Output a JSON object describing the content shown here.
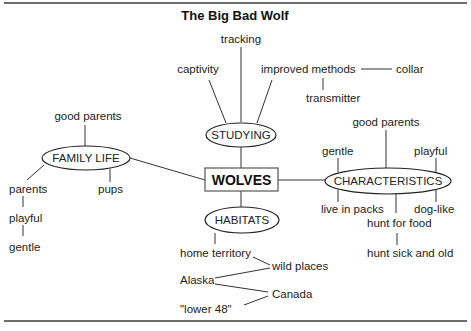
{
  "title": "The Big Bad Wolf",
  "center": "WOLVES",
  "nodes": {
    "studying": "STUDYING",
    "family_life": "FAMILY LIFE",
    "characteristics": "CHARACTERISTICS",
    "habitats": "HABITATS"
  },
  "studying": {
    "tracking": "tracking",
    "captivity": "captivity",
    "improved_methods": "improved methods",
    "collar": "collar",
    "transmitter": "transmitter"
  },
  "family_life": {
    "good_parents": "good parents",
    "parents": "parents",
    "pups": "pups",
    "playful": "playful",
    "gentle": "gentle"
  },
  "characteristics": {
    "good_parents": "good parents",
    "gentle": "gentle",
    "playful": "playful",
    "live_in_packs": "live in packs",
    "dog_like": "dog-like",
    "hunt_for_food": "hunt for food",
    "hunt_sick_and_old": "hunt sick and old"
  },
  "habitats": {
    "home_territory": "home territory",
    "wild_places": "wild places",
    "alaska": "Alaska",
    "canada": "Canada",
    "lower_48": "\"lower 48\""
  }
}
